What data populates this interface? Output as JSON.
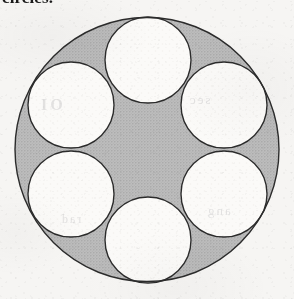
{
  "page": {
    "width": 294,
    "height": 299,
    "background_color": "#f6f5f3",
    "medium": "scanned-book-page"
  },
  "caption": {
    "clipped_fragment": "circles.",
    "note": "bottom sliver of a text line clipped by the top edge of the crop"
  },
  "bleed_through": {
    "fragment_1": "OI",
    "fragment_2": "sec",
    "fragment_3": "ang",
    "fragment_4": "rad"
  },
  "figure": {
    "shade_color": "#b9b9b9",
    "white_color": "#fbfaf8",
    "stroke_color": "#2b2b2b",
    "stroke_width": 1.4,
    "outer_circle": {
      "name": "outer-circle",
      "cx": 147,
      "cy": 149.5,
      "r": 132
    },
    "inner_radius": 43,
    "inner_circles": [
      {
        "name": "inner-circle-top",
        "position": "top",
        "cx": 148,
        "cy": 60,
        "r": 43
      },
      {
        "name": "inner-circle-upper-right",
        "position": "upper-right",
        "cx": 224,
        "cy": 105,
        "r": 43
      },
      {
        "name": "inner-circle-lower-right",
        "position": "lower-right",
        "cx": 224,
        "cy": 194,
        "r": 43
      },
      {
        "name": "inner-circle-bottom",
        "position": "bottom",
        "cx": 148,
        "cy": 240,
        "r": 43
      },
      {
        "name": "inner-circle-lower-left",
        "position": "lower-left",
        "cx": 71,
        "cy": 194,
        "r": 43
      },
      {
        "name": "inner-circle-upper-left",
        "position": "upper-left",
        "cx": 71,
        "cy": 105,
        "r": 43
      }
    ]
  }
}
